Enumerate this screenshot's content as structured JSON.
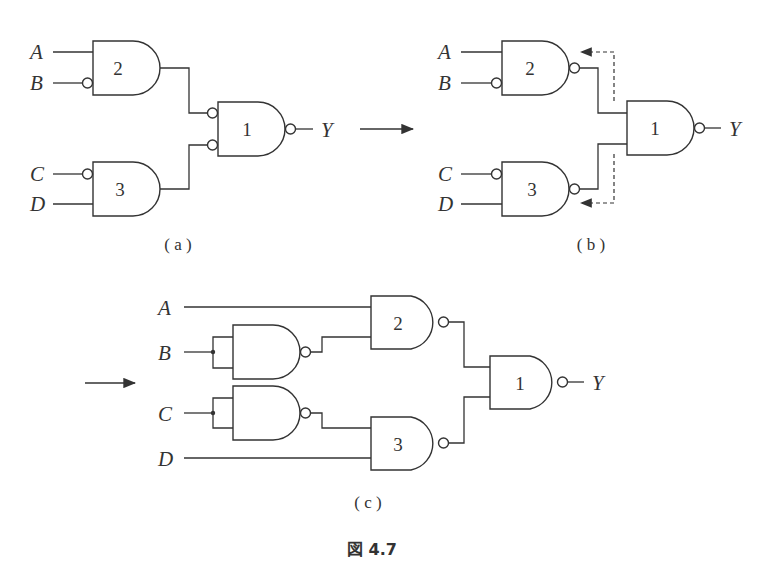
{
  "figure": {
    "caption": "図 4.7",
    "transform_arrows": 2
  },
  "panels": [
    {
      "id": "a",
      "caption": "( a )",
      "inputs": [
        "A",
        "B",
        "C",
        "D"
      ],
      "output": "Y",
      "gates": [
        {
          "id": "2",
          "type": "AND",
          "inputs": [
            "A",
            "¬B"
          ],
          "inverted_output": false
        },
        {
          "id": "3",
          "type": "AND",
          "inputs": [
            "¬C",
            "D"
          ],
          "inverted_output": false
        },
        {
          "id": "1",
          "type": "NAND (inverted inputs)",
          "inputs": [
            "¬gate2",
            "¬gate3"
          ],
          "inverted_output": true
        }
      ]
    },
    {
      "id": "b",
      "caption": "( b )",
      "inputs": [
        "A",
        "B",
        "C",
        "D"
      ],
      "output": "Y",
      "gates": [
        {
          "id": "2",
          "type": "NAND",
          "inputs": [
            "A",
            "¬B"
          ],
          "inverted_output": true
        },
        {
          "id": "3",
          "type": "NAND",
          "inputs": [
            "¬C",
            "D"
          ],
          "inverted_output": true
        },
        {
          "id": "1",
          "type": "NAND",
          "inputs": [
            "gate2",
            "gate3"
          ],
          "inverted_output": true
        }
      ],
      "annotation": "dashed arrows: inversion bubbles moved from gate 1 inputs to gate 2/3 outputs"
    },
    {
      "id": "c",
      "caption": "( c )",
      "inputs": [
        "A",
        "B",
        "C",
        "D"
      ],
      "output": "Y",
      "gates": [
        {
          "id": "inv-B",
          "type": "NAND (tied inputs)",
          "inputs": [
            "B",
            "B"
          ],
          "inverted_output": true
        },
        {
          "id": "inv-C",
          "type": "NAND (tied inputs)",
          "inputs": [
            "C",
            "C"
          ],
          "inverted_output": true
        },
        {
          "id": "2",
          "type": "NAND",
          "inputs": [
            "A",
            "inv-B"
          ],
          "inverted_output": true
        },
        {
          "id": "3",
          "type": "NAND",
          "inputs": [
            "inv-C",
            "D"
          ],
          "inverted_output": true
        },
        {
          "id": "1",
          "type": "NAND",
          "inputs": [
            "gate2",
            "gate3"
          ],
          "inverted_output": true
        }
      ]
    }
  ],
  "labels": {
    "A": "A",
    "B": "B",
    "C": "C",
    "D": "D",
    "Y": "Y",
    "g1": "1",
    "g2": "2",
    "g3": "3"
  }
}
